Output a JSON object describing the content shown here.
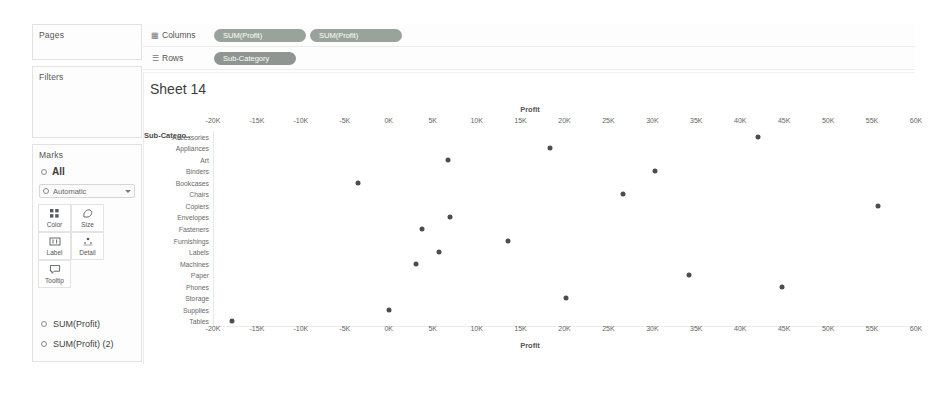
{
  "panels": {
    "pages": {
      "title": "Pages"
    },
    "filters": {
      "title": "Filters"
    },
    "marks": {
      "title": "Marks",
      "all_label": "All",
      "mark_type": "Automatic",
      "properties": [
        {
          "label": "Color",
          "icon": "color-icon"
        },
        {
          "label": "Size",
          "icon": "size-icon"
        },
        {
          "label": "Label",
          "icon": "label-icon"
        },
        {
          "label": "Detail",
          "icon": "detail-icon"
        },
        {
          "label": "Tooltip",
          "icon": "tooltip-icon"
        }
      ],
      "mark_cards": [
        "SUM(Profit)",
        "SUM(Profit) (2)"
      ]
    }
  },
  "shelves": {
    "columns": {
      "label": "Columns",
      "icon": "columns-icon",
      "pills": [
        "SUM(Profit)",
        "SUM(Profit)"
      ]
    },
    "rows": {
      "label": "Rows",
      "icon": "rows-icon",
      "pills": [
        "Sub-Category"
      ]
    }
  },
  "view": {
    "sheet_title": "Sheet 14",
    "row_header_title": "Sub-Catego.."
  },
  "chart_data": {
    "type": "scatter",
    "title": "Sheet 14",
    "xlabel": "Profit",
    "ylabel": "Sub-Category",
    "xlim": [
      -20000,
      60000
    ],
    "xtick_labels": [
      "-20K",
      "-15K",
      "-10K",
      "-5K",
      "0K",
      "5K",
      "10K",
      "15K",
      "20K",
      "25K",
      "30K",
      "35K",
      "40K",
      "45K",
      "50K",
      "55K",
      "60K"
    ],
    "xtick_values": [
      -20000,
      -15000,
      -10000,
      -5000,
      0,
      5000,
      10000,
      15000,
      20000,
      25000,
      30000,
      35000,
      40000,
      45000,
      50000,
      55000,
      60000
    ],
    "categories": [
      "Accessories",
      "Appliances",
      "Art",
      "Binders",
      "Bookcases",
      "Chairs",
      "Copiers",
      "Envelopes",
      "Fasteners",
      "Furnishings",
      "Labels",
      "Machines",
      "Paper",
      "Phones",
      "Storage",
      "Supplies",
      "Tables"
    ],
    "grid": false,
    "legend": "none",
    "axis_position": "both",
    "series": [
      {
        "name": "SUM(Profit)",
        "points": [
          {
            "category": "Accessories",
            "value": 41900
          },
          {
            "category": "Appliances",
            "value": 18200
          },
          {
            "category": "Art",
            "value": 6600
          },
          {
            "category": "Binders",
            "value": 30200
          },
          {
            "category": "Bookcases",
            "value": -3600
          },
          {
            "category": "Chairs",
            "value": 26600
          },
          {
            "category": "Copiers",
            "value": 55600
          },
          {
            "category": "Envelopes",
            "value": 6900
          },
          {
            "category": "Fasteners",
            "value": 3700
          },
          {
            "category": "Furnishings",
            "value": 13400
          },
          {
            "category": "Labels",
            "value": 5600
          },
          {
            "category": "Machines",
            "value": 3000
          },
          {
            "category": "Paper",
            "value": 34100
          },
          {
            "category": "Phones",
            "value": 44600
          },
          {
            "category": "Storage",
            "value": 20100
          },
          {
            "category": "Supplies",
            "value": -100
          },
          {
            "category": "Tables",
            "value": -17900
          }
        ]
      }
    ]
  }
}
